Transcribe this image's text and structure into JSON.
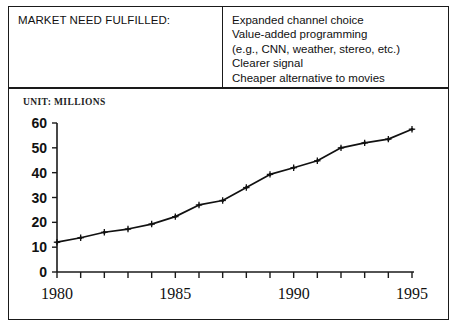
{
  "need_table": {
    "title": "MARKET NEED FULFILLED:",
    "items": [
      "Expanded channel choice",
      "Value-added programming",
      "(e.g., CNN, weather, stereo, etc.)",
      "Clearer signal",
      "Cheaper alternative to movies"
    ]
  },
  "chart_panel": {
    "unit_label": "UNIT: MILLIONS"
  },
  "chart_data": {
    "type": "line",
    "title": "",
    "subtitle": "",
    "xlabel": "",
    "ylabel": "UNIT: MILLIONS",
    "x": [
      1980,
      1981,
      1982,
      1983,
      1984,
      1985,
      1986,
      1987,
      1988,
      1989,
      1990,
      1991,
      1992,
      1993,
      1994,
      1995
    ],
    "values": [
      12,
      13.8,
      16,
      17.3,
      19.3,
      22.3,
      27,
      28.8,
      34,
      39.3,
      42,
      44.8,
      50,
      52,
      53.5,
      57.5
    ],
    "series": [
      {
        "name": "Subscribers",
        "values": [
          12,
          13.8,
          16,
          17.3,
          19.3,
          22.3,
          27,
          28.8,
          34,
          39.3,
          42,
          44.8,
          50,
          52,
          53.5,
          57.5
        ]
      }
    ],
    "ylim": [
      0,
      60
    ],
    "xlim": [
      1980,
      1995
    ],
    "yticks": [
      0,
      10,
      20,
      30,
      40,
      50,
      60
    ],
    "ytick_labels": [
      "0",
      "10",
      "20",
      "30",
      "40",
      "50",
      "60"
    ],
    "xticks": [
      1980,
      1981,
      1982,
      1983,
      1984,
      1985,
      1986,
      1987,
      1988,
      1989,
      1990,
      1991,
      1992,
      1993,
      1994,
      1995
    ],
    "xtick_labels_shown": [
      "1980",
      "1985",
      "1990",
      "1995"
    ],
    "xtick_labels_shown_values": [
      1980,
      1985,
      1990,
      1995
    ],
    "grid": false,
    "legend": "none",
    "marker": "cross-dot",
    "line_color": "#111111"
  }
}
